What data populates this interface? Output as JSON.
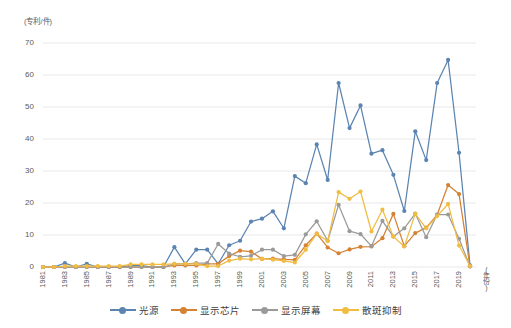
{
  "chart_data": {
    "type": "line",
    "title": "",
    "xlabel": "(年份)",
    "ylabel": "(专利/件)",
    "ylim": [
      0,
      70
    ],
    "yticks": [
      0,
      10,
      20,
      30,
      40,
      50,
      60,
      70
    ],
    "grid": true,
    "legend_position": "bottom",
    "x": [
      1981,
      1982,
      1983,
      1984,
      1985,
      1986,
      1987,
      1988,
      1989,
      1990,
      1991,
      1992,
      1993,
      1994,
      1995,
      1996,
      1997,
      1998,
      1999,
      2000,
      2001,
      2002,
      2003,
      2004,
      2005,
      2006,
      2007,
      2008,
      2009,
      2010,
      2011,
      2012,
      2013,
      2014,
      2015,
      2016,
      2017,
      2018,
      2019,
      2020
    ],
    "categories": [
      "1981",
      "1982",
      "1983",
      "1984",
      "1985",
      "1986",
      "1987",
      "1988",
      "1989",
      "1990",
      "1991",
      "1992",
      "1993",
      "1994",
      "1995",
      "1996",
      "1997",
      "1998",
      "1999",
      "2000",
      "2001",
      "2002",
      "2003",
      "2004",
      "2005",
      "2006",
      "2007",
      "2008",
      "2009",
      "2010",
      "2011",
      "2012",
      "2013",
      "2014",
      "2015",
      "2016",
      "2017",
      "2018",
      "2019",
      "2020"
    ],
    "xtick_labels": [
      "1981",
      "1983",
      "1985",
      "1987",
      "1989",
      "1991",
      "1993",
      "1995",
      "1997",
      "1999",
      "2001",
      "2003",
      "2005",
      "2007",
      "2009",
      "2011",
      "2013",
      "2015",
      "2017",
      "2019"
    ],
    "series": [
      {
        "name": "光源",
        "color": "#5b84b1",
        "values": [
          0,
          0,
          1.2,
          0,
          1,
          0,
          0,
          0,
          0.4,
          0.4,
          0,
          0,
          6.2,
          1,
          5.4,
          5.4,
          1,
          6.8,
          8.2,
          14.2,
          15.1,
          17.4,
          12.1,
          28.4,
          26.2,
          38.3,
          27.2,
          57.5,
          43.4,
          50.5,
          35.4,
          36.5,
          28.8,
          17.5,
          42.4,
          33.4,
          57.5,
          64.7,
          35.7,
          0.5
        ]
      },
      {
        "name": "显示芯片",
        "color": "#d58234",
        "values": [
          0,
          0,
          0,
          0,
          0,
          0,
          0,
          0,
          0,
          0,
          0,
          0,
          0.5,
          0.5,
          0.5,
          1,
          1,
          3.4,
          5.1,
          4.8,
          2.5,
          2.6,
          2.4,
          2.2,
          6.8,
          10.4,
          6.1,
          4.3,
          5.5,
          6.3,
          6.4,
          9,
          16.6,
          6.5,
          10.6,
          12.3,
          16.3,
          25.6,
          22.8,
          0.2
        ]
      },
      {
        "name": "显示屏幕",
        "color": "#9a9a9a",
        "values": [
          0,
          0,
          0,
          0,
          0,
          0,
          0,
          0,
          0,
          0,
          0,
          0,
          1,
          1,
          1.2,
          1.2,
          7.2,
          4.2,
          3.2,
          3.5,
          5.4,
          5.4,
          3.4,
          3.8,
          10.2,
          14.3,
          8.2,
          19.4,
          11.2,
          10.3,
          6.5,
          14.4,
          9.5,
          12.1,
          16.7,
          9.3,
          16.4,
          16.4,
          8.8,
          0.2
        ]
      },
      {
        "name": "散斑抑制",
        "color": "#f0bc42",
        "values": [
          0,
          0,
          0.3,
          0.3,
          0.3,
          0.3,
          0.3,
          0.3,
          0.8,
          0.8,
          0.8,
          0.8,
          1,
          1,
          1,
          0.3,
          0.3,
          2,
          2.6,
          2.4,
          2.6,
          2.3,
          1.9,
          1.4,
          5.4,
          10.4,
          8.1,
          23.4,
          21.3,
          23.6,
          11.1,
          17.9,
          9.5,
          6.4,
          16.6,
          12.1,
          15.9,
          19.7,
          6.7,
          0.3
        ]
      }
    ]
  },
  "legend": {
    "items": [
      {
        "label": "光源",
        "color": "#5b84b1",
        "icon": "line-marker-icon"
      },
      {
        "label": "显示芯片",
        "color": "#d58234",
        "icon": "line-marker-icon"
      },
      {
        "label": "显示屏幕",
        "color": "#9a9a9a",
        "icon": "line-marker-icon"
      },
      {
        "label": "散斑抑制",
        "color": "#f0bc42",
        "icon": "line-marker-icon"
      }
    ]
  },
  "axes": {
    "y_unit": "(专利/件)",
    "x_unit": "(年份)"
  }
}
